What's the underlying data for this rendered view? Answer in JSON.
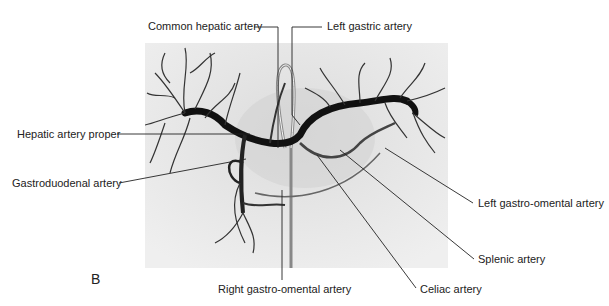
{
  "figure": {
    "panel_label": "B",
    "image_alt": "Celiac trunk angiogram",
    "labels": {
      "common_hepatic": "Common hepatic artery",
      "left_gastric": "Left gastric artery",
      "hepatic_proper": "Hepatic artery proper",
      "gastroduodenal": "Gastroduodenal artery",
      "left_gastro_omental": "Left gastro-omental artery",
      "splenic": "Splenic artery",
      "right_gastro_omental": "Right gastro-omental artery",
      "celiac": "Celiac artery"
    }
  }
}
